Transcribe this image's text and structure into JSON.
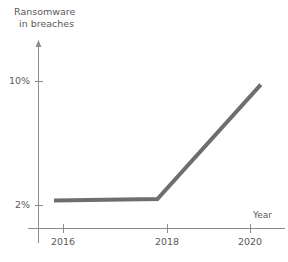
{
  "chart_data": {
    "type": "line",
    "title": "",
    "ylabel": "Ransomware in breaches",
    "ylabel_line1": "Ransomware",
    "ylabel_line2": "in breaches",
    "xlabel": "Year",
    "x": [
      2016,
      2018,
      2020
    ],
    "xtick_labels": [
      "2016",
      "2018",
      "2020"
    ],
    "ytick_labels": [
      "2%",
      "10%"
    ],
    "ytick_values": [
      2,
      10
    ],
    "series": [
      {
        "name": "Ransomware in breaches",
        "values": [
          1.9,
          2.0,
          9.8
        ],
        "color": "#6e6e6e",
        "line_width": 4
      }
    ],
    "xlim": [
      2015.7,
      2020.1
    ],
    "ylim": [
      0,
      12.5
    ],
    "grid": false,
    "legend": false,
    "axis_color": "#8c8c8c",
    "text_color": "#595959",
    "background": "#ffffff"
  },
  "axes": {
    "y_axis_name": "y-axis",
    "x_axis_name": "x-axis",
    "y_arrow": "arrow-up-icon"
  }
}
